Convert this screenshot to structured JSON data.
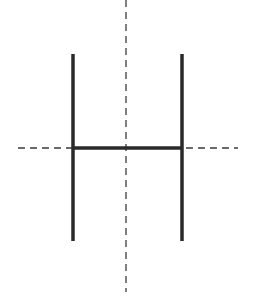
{
  "diagram": {
    "colors": {
      "background": "#ffffff",
      "shape_stroke": "#2a2a2a",
      "axis_stroke": "#3a3a3a"
    },
    "shape": {
      "letter": "H",
      "left_stroke": {
        "x": 73,
        "y1": 54,
        "y2": 241
      },
      "right_stroke": {
        "x": 182,
        "y1": 54,
        "y2": 241
      },
      "crossbar": {
        "y": 148,
        "x1": 73,
        "x2": 182
      },
      "stroke_width": 3.5
    },
    "symmetry_axes": [
      {
        "orientation": "vertical",
        "x": 126,
        "y1": 0,
        "y2": 292,
        "style": "dashed"
      },
      {
        "orientation": "horizontal",
        "y": 148,
        "x1": 18,
        "x2": 238,
        "style": "dashed"
      }
    ]
  }
}
